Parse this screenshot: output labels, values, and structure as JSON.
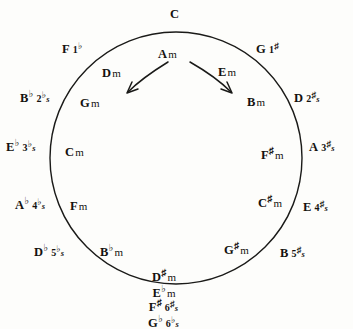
{
  "diagram": {
    "center": {
      "x": 176,
      "y": 158
    },
    "radius": 126,
    "stroke_color": "#1a1a18",
    "background": "#fdfdfb"
  },
  "top_key": {
    "root": "C",
    "acc": "",
    "count": "",
    "sign": ""
  },
  "major_keys": [
    {
      "id": "F",
      "root": "F",
      "acc": "",
      "count": "1",
      "sign": "♭",
      "plural": "",
      "x": 62,
      "y": 40,
      "align": "left"
    },
    {
      "id": "G",
      "root": "G",
      "acc": "",
      "count": "1",
      "sign": "♯",
      "plural": "",
      "x": 256,
      "y": 40,
      "align": "left"
    },
    {
      "id": "Bb",
      "root": "B",
      "acc": "♭",
      "count": "2",
      "sign": "♭",
      "plural": "s",
      "x": 20,
      "y": 89,
      "align": "left"
    },
    {
      "id": "D",
      "root": "D",
      "acc": "",
      "count": "2",
      "sign": "♯",
      "plural": "s",
      "x": 294,
      "y": 89,
      "align": "left"
    },
    {
      "id": "Eb",
      "root": "E",
      "acc": "♭",
      "count": "3",
      "sign": "♭",
      "plural": "s",
      "x": 6,
      "y": 138,
      "align": "left"
    },
    {
      "id": "A",
      "root": "A",
      "acc": "",
      "count": "3",
      "sign": "♯",
      "plural": "s",
      "x": 309,
      "y": 138,
      "align": "left"
    },
    {
      "id": "Ab",
      "root": "A",
      "acc": "♭",
      "count": "4",
      "sign": "♭",
      "plural": "s",
      "x": 15,
      "y": 196,
      "align": "left"
    },
    {
      "id": "E",
      "root": "E",
      "acc": "",
      "count": "4",
      "sign": "♯",
      "plural": "s",
      "x": 303,
      "y": 198,
      "align": "left"
    },
    {
      "id": "Db",
      "root": "D",
      "acc": "♭",
      "count": "5",
      "sign": "♭",
      "plural": "s",
      "x": 34,
      "y": 243,
      "align": "left"
    },
    {
      "id": "B",
      "root": "B",
      "acc": "",
      "count": "5",
      "sign": "♯",
      "plural": "s",
      "x": 280,
      "y": 244,
      "align": "left"
    }
  ],
  "minor_keys": [
    {
      "id": "Am",
      "root": "A",
      "acc": "",
      "m": "m",
      "x": 158,
      "y": 45,
      "align": "left"
    },
    {
      "id": "Dm",
      "root": "D",
      "acc": "",
      "m": "m",
      "x": 102,
      "y": 64,
      "align": "left"
    },
    {
      "id": "Em",
      "root": "E",
      "acc": "",
      "m": "m",
      "x": 218,
      "y": 63,
      "align": "left"
    },
    {
      "id": "Gm",
      "root": "G",
      "acc": "",
      "m": "m",
      "x": 80,
      "y": 94,
      "align": "left"
    },
    {
      "id": "Bm",
      "root": "B",
      "acc": "",
      "m": "m",
      "x": 247,
      "y": 93,
      "align": "left"
    },
    {
      "id": "Cm",
      "root": "C",
      "acc": "",
      "m": "m",
      "x": 65,
      "y": 143,
      "align": "left"
    },
    {
      "id": "F#m",
      "root": "F",
      "acc": "♯",
      "m": "m",
      "x": 261,
      "y": 146,
      "align": "left"
    },
    {
      "id": "Fm",
      "root": "F",
      "acc": "",
      "m": "m",
      "x": 70,
      "y": 197,
      "align": "left"
    },
    {
      "id": "C#m",
      "root": "C",
      "acc": "♯",
      "m": "m",
      "x": 258,
      "y": 194,
      "align": "left"
    },
    {
      "id": "Bbm",
      "root": "B",
      "acc": "♭",
      "m": "m",
      "x": 100,
      "y": 243,
      "align": "left"
    },
    {
      "id": "G#m",
      "root": "G",
      "acc": "♯",
      "m": "m",
      "x": 224,
      "y": 241,
      "align": "left"
    }
  ],
  "bottom_inside": {
    "line1": {
      "root": "D",
      "acc": "♯",
      "m": "m"
    },
    "line2": {
      "root": "E",
      "acc": "♭",
      "m": "m"
    },
    "x": 152,
    "y": 268
  },
  "bottom_outside": {
    "line1": {
      "root": "F",
      "acc": "♯",
      "count": "6",
      "sign": "♯",
      "plural": "s"
    },
    "line2": {
      "root": "G",
      "acc": "♭",
      "count": "6",
      "sign": "♭",
      "plural": "s"
    },
    "x": 148,
    "y": 298
  },
  "arrows": [
    {
      "id": "arrow-counterclockwise",
      "from": "Am",
      "to": "Dm-direction"
    },
    {
      "id": "arrow-clockwise",
      "from": "Am",
      "to": "Em-direction"
    }
  ]
}
